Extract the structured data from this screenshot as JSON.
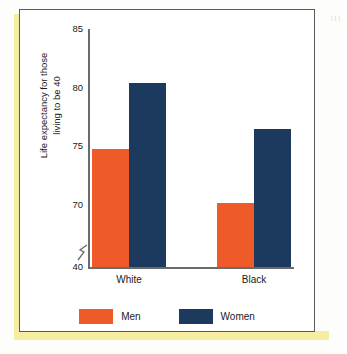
{
  "figure": {
    "right_margin_marks": "|\n|\n|"
  },
  "chart_data": {
    "type": "bar",
    "title": "",
    "xlabel": "",
    "ylabel": "Life expectancy for those living to be 40",
    "ylabel_line1": "Life expectancy for those",
    "ylabel_line2": "living to be 40",
    "categories": [
      "White",
      "Black"
    ],
    "series": [
      {
        "name": "Men",
        "color": "#ee5a28",
        "values": [
          74.8,
          70.2
        ]
      },
      {
        "name": "Women",
        "color": "#1c3a5e",
        "values": [
          80.4,
          76.5
        ]
      }
    ],
    "ylim": [
      40,
      85
    ],
    "yticks": [
      85,
      80,
      75,
      70,
      40
    ],
    "ytick_labels": [
      "85",
      "80",
      "75",
      "70",
      "40"
    ],
    "axis_break": true,
    "axis_break_between": [
      40,
      70
    ],
    "grid": false,
    "legend_position": "bottom"
  }
}
